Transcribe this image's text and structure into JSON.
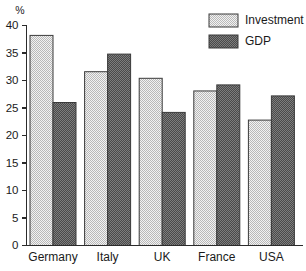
{
  "chart_data": {
    "type": "bar",
    "title": "",
    "xlabel": "",
    "ylabel": "%",
    "ylim": [
      0,
      40
    ],
    "ytick_step": 5,
    "yticks": [
      "0",
      "5",
      "10",
      "15",
      "20",
      "25",
      "30",
      "35",
      "40"
    ],
    "grid": false,
    "legend_position": "top-right",
    "categories": [
      "Germany",
      "Italy",
      "UK",
      "France",
      "USA"
    ],
    "series": [
      {
        "name": "Investment",
        "color": "#d8d8d8",
        "pattern": "light-checker",
        "values": [
          38.2,
          31.6,
          30.4,
          28.1,
          22.8
        ]
      },
      {
        "name": "GDP",
        "color": "#585858",
        "pattern": "dark-checker",
        "values": [
          26.0,
          34.8,
          24.2,
          29.2,
          27.2
        ]
      }
    ]
  },
  "axis": {
    "unit_label": "%"
  },
  "legend": {
    "entries": [
      {
        "label": "Investment"
      },
      {
        "label": "GDP"
      }
    ]
  },
  "colors": {
    "axis": "#2b2b2b",
    "text": "#1a1a1a",
    "investment_fill": "#d8d8d8",
    "gdp_fill": "#585858",
    "background": "#ffffff"
  }
}
